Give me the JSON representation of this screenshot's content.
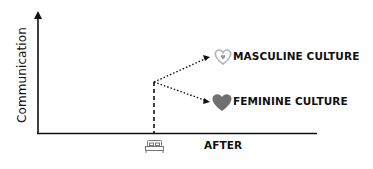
{
  "diagram": {
    "y_axis_label": "Communication",
    "x_axis_label": "AFTER",
    "branches": [
      {
        "label": "MASCULINE CULTURE",
        "icon": "heart-outline-icon",
        "icon_color": "#b5b5b5",
        "direction": "up"
      },
      {
        "label": "FEMININE CULTURE",
        "icon": "heart-filled-icon",
        "icon_color": "#707070",
        "direction": "down"
      }
    ],
    "marker_icon": "bed-icon",
    "colors": {
      "axis": "#111111",
      "text": "#111111",
      "heart_outline": "#b5b5b5",
      "heart_filled": "#707070"
    }
  }
}
